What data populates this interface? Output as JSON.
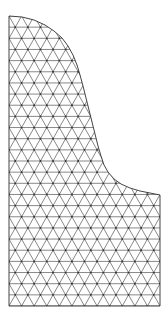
{
  "figure": {
    "type": "triangular-mesh",
    "background": "#ffffff",
    "line_color": "#555555",
    "boundary_color": "#444444",
    "node_color": "#333333"
  },
  "domain_shape": {
    "left_x": 9,
    "right_x": 160,
    "top_y": 16,
    "bottom_y": 306,
    "curve_end_y": 195,
    "curved_boundary": [
      [
        9,
        16
      ],
      [
        22,
        17
      ],
      [
        34,
        20
      ],
      [
        45,
        25
      ],
      [
        54,
        31
      ],
      [
        62,
        38
      ],
      [
        68,
        46
      ],
      [
        73,
        55
      ],
      [
        77,
        65
      ],
      [
        80,
        75
      ],
      [
        83,
        86
      ],
      [
        86,
        98
      ],
      [
        89,
        110
      ],
      [
        92,
        122
      ],
      [
        95,
        134
      ],
      [
        98,
        146
      ],
      [
        101,
        156
      ],
      [
        104,
        165
      ],
      [
        108,
        172
      ],
      [
        114,
        179
      ],
      [
        121,
        184
      ],
      [
        130,
        188
      ],
      [
        140,
        191
      ],
      [
        150,
        193
      ],
      [
        160,
        195
      ]
    ]
  },
  "mesh": {
    "spacing_x": 12.6,
    "spacing_y": 11.1,
    "rows": 26
  }
}
